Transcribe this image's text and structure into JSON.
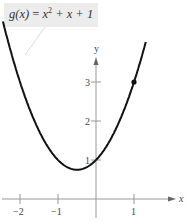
{
  "chart_data": {
    "type": "line",
    "title": "",
    "function_label": "g(x) = x² + x + 1",
    "xlabel": "x",
    "ylabel": "y",
    "x_ticks": [
      "−2",
      "−1",
      "1"
    ],
    "y_ticks": [
      "1",
      "2",
      "3"
    ],
    "xlim": [
      -2.5,
      2.3
    ],
    "ylim": [
      -0.6,
      4.0
    ],
    "series": [
      {
        "name": "g(x) = x^2 + x + 1",
        "x": [
          -2.4,
          -2,
          -1.5,
          -1,
          -0.5,
          0,
          0.5,
          1,
          1.3
        ],
        "values": [
          4.36,
          3,
          1.75,
          1,
          0.75,
          1,
          1.75,
          3,
          3.99
        ]
      }
    ],
    "points": [
      {
        "x": 1,
        "y": 3,
        "marker": "filled-dot"
      }
    ],
    "grid": false,
    "legend": "none"
  },
  "label": {
    "lhs": "g(x)",
    "rhs_var": "x",
    "exp": "2",
    "rest": "+ x + 1"
  },
  "colors": {
    "curve": "#111111",
    "axis": "#999999",
    "label_bg": "#ececec"
  }
}
